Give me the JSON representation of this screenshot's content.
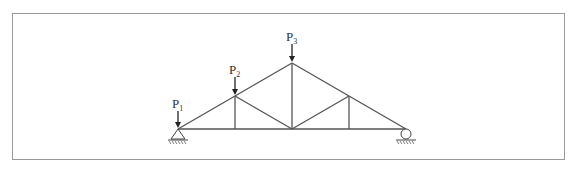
{
  "diagram": {
    "type": "truss",
    "loads": [
      {
        "id": "P1",
        "label": "P",
        "subscript": "1",
        "node": "left-support"
      },
      {
        "id": "P2",
        "label": "P",
        "subscript": "2",
        "node": "top-chord-left-mid"
      },
      {
        "id": "P3",
        "label": "P",
        "subscript": "3",
        "node": "apex"
      }
    ],
    "supports": [
      {
        "type": "pin",
        "position": "left"
      },
      {
        "type": "roller",
        "position": "right"
      }
    ],
    "colors": {
      "line": "#555555",
      "frame": "#9a9a9a",
      "background": "#ffffff"
    }
  }
}
